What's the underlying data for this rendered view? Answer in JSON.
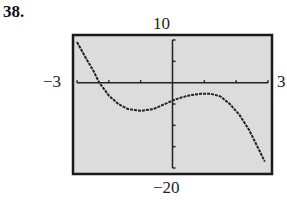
{
  "problem_number": "38.",
  "chart_data": {
    "type": "line",
    "title": "",
    "xlabel": "",
    "ylabel": "",
    "xlim": [
      -3,
      3
    ],
    "ylim": [
      -20,
      10
    ],
    "x_tick_step": 1,
    "y_tick_step": 5,
    "grid": false,
    "window_labels": {
      "xmin": "−3",
      "xmax": "3",
      "ymin": "−20",
      "ymax": "10"
    },
    "series": [
      {
        "name": "f(x)",
        "x": [
          -3.0,
          -2.7,
          -2.5,
          -2.3,
          -2.0,
          -1.7,
          -1.4,
          -1.0,
          -0.6,
          -0.3,
          0.0,
          0.3,
          0.6,
          0.9,
          1.2,
          1.5,
          1.8,
          2.1,
          2.4,
          2.7,
          2.9
        ],
        "y": [
          9.5,
          5.5,
          3.0,
          0.0,
          -3.0,
          -5.0,
          -6.2,
          -6.6,
          -6.2,
          -5.2,
          -4.2,
          -3.4,
          -2.9,
          -2.6,
          -2.6,
          -3.2,
          -5.0,
          -7.5,
          -11.0,
          -15.5,
          -18.5
        ]
      }
    ]
  }
}
